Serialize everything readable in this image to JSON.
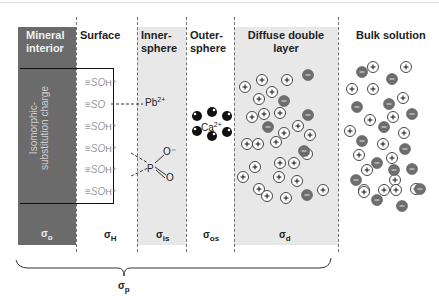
{
  "headers": {
    "mineral": "Mineral interior",
    "surface": "Surface",
    "inner": "Inner-sphere",
    "outer": "Outer-sphere",
    "ddl": "Diffuse double layer",
    "bulk": "Bulk solution"
  },
  "mineral_label": "Isomorphic-substitution charge",
  "surface_groups": [
    {
      "text": "≡SO",
      "suffix": "H⁺"
    },
    {
      "text": "≡SO",
      "suffix": ""
    },
    {
      "text": "≡SO",
      "suffix": "H⁺"
    },
    {
      "text": "≡SO",
      "suffix": "H⁺"
    },
    {
      "text": "≡SO",
      "suffix": "H⁺"
    },
    {
      "text": "≡SO",
      "suffix": "H⁺"
    }
  ],
  "inner_ions": {
    "lead": "Pb",
    "lead_charge": "2+",
    "phosphorus": "P",
    "o_minus": "O⁻",
    "o_double": "O"
  },
  "outer_ion": {
    "symbol": "Ca",
    "charge": "2+"
  },
  "sigmas": {
    "o": {
      "symbol": "σ",
      "sub": "o"
    },
    "h": {
      "symbol": "σ",
      "sub": "H"
    },
    "is": {
      "symbol": "σ",
      "sub": "is"
    },
    "os": {
      "symbol": "σ",
      "sub": "os"
    },
    "d": {
      "symbol": "σ",
      "sub": "d"
    },
    "p": {
      "symbol": "σ",
      "sub": "p"
    }
  },
  "colors": {
    "mineral": "#6b6b6b",
    "layer_gray": "#e8e8e8",
    "anion": "#6e6e6e",
    "cation_fill": "#ffffff",
    "water": "#111111"
  },
  "ddl_ions": {
    "cations": [
      [
        245,
        87
      ],
      [
        262,
        80
      ],
      [
        287,
        80
      ],
      [
        272,
        92
      ],
      [
        259,
        99
      ],
      [
        264,
        114
      ],
      [
        280,
        113
      ],
      [
        252,
        117
      ],
      [
        298,
        126
      ],
      [
        310,
        135
      ],
      [
        284,
        133
      ],
      [
        276,
        142
      ],
      [
        247,
        144
      ],
      [
        258,
        144
      ],
      [
        307,
        154
      ],
      [
        280,
        163
      ],
      [
        294,
        163
      ],
      [
        255,
        167
      ],
      [
        279,
        177
      ],
      [
        297,
        181
      ],
      [
        243,
        177
      ],
      [
        323,
        190
      ],
      [
        259,
        189
      ],
      [
        267,
        196
      ],
      [
        286,
        198
      ]
    ],
    "anions": [
      [
        308,
        75
      ],
      [
        284,
        101
      ],
      [
        308,
        115
      ],
      [
        268,
        127
      ],
      [
        304,
        151
      ],
      [
        307,
        195
      ]
    ]
  },
  "bulk_ions": {
    "cations": [
      [
        373,
        67
      ],
      [
        406,
        67
      ],
      [
        352,
        89
      ],
      [
        373,
        89
      ],
      [
        403,
        98
      ],
      [
        370,
        120
      ],
      [
        393,
        117
      ],
      [
        350,
        131
      ],
      [
        404,
        133
      ],
      [
        383,
        144
      ],
      [
        359,
        155
      ],
      [
        392,
        158
      ],
      [
        367,
        170
      ],
      [
        395,
        180
      ],
      [
        384,
        190
      ],
      [
        364,
        190
      ],
      [
        364,
        192
      ],
      [
        396,
        190
      ],
      [
        416,
        189
      ]
    ],
    "anions": [
      [
        362,
        72
      ],
      [
        392,
        79
      ],
      [
        389,
        104
      ],
      [
        357,
        107
      ],
      [
        412,
        114
      ],
      [
        384,
        127
      ],
      [
        362,
        141
      ],
      [
        405,
        149
      ],
      [
        377,
        163
      ],
      [
        394,
        170
      ],
      [
        412,
        169
      ],
      [
        356,
        180
      ],
      [
        420,
        189
      ],
      [
        377,
        200
      ],
      [
        402,
        206
      ]
    ]
  }
}
